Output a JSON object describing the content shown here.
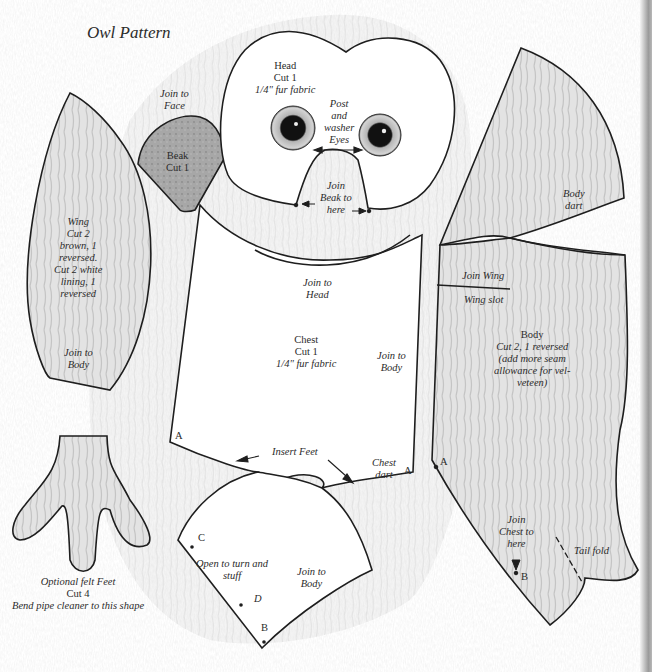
{
  "title": "Owl Pattern",
  "pieces": {
    "beak": {
      "note_above": [
        "Join to",
        "Face"
      ],
      "label": [
        "Beak",
        "Cut 1"
      ]
    },
    "head": {
      "label": [
        "Head",
        "Cut 1",
        "1/4\" fur fabric"
      ],
      "eyes_note": [
        "Post",
        "and",
        "washer",
        "Eyes"
      ],
      "beak_join": [
        "Join",
        "Beak to",
        "here"
      ]
    },
    "wing": {
      "label": [
        "Wing",
        "Cut 2",
        "brown, 1",
        "reversed.",
        "Cut 2 white",
        "lining, 1",
        "reversed"
      ],
      "join": [
        "Join to",
        "Body"
      ]
    },
    "chest": {
      "join_head": [
        "Join to",
        "Head"
      ],
      "label": [
        "Chest",
        "Cut 1",
        "1/4\" fur fabric"
      ],
      "join_body": [
        "Join to",
        "Body"
      ],
      "insert_feet": "Insert Feet",
      "chest_dart": [
        "Chest",
        "dart"
      ],
      "point_a_left": "A",
      "point_a_right": "A"
    },
    "chest_lower": {
      "open_note": [
        "Open to turn and",
        "stuff"
      ],
      "join_body": [
        "Join to",
        "Body"
      ],
      "point_c": "C",
      "point_d": "D",
      "point_b": "B"
    },
    "body": {
      "dart": [
        "Body",
        "dart"
      ],
      "join_wing": "Join Wing",
      "wing_slot": "Wing slot",
      "label": [
        "Body",
        "Cut 2, 1 reversed",
        "(add more seam",
        "allowance for vel-",
        "veteen)"
      ],
      "join_chest": [
        "Join",
        "Chest to",
        "here"
      ],
      "tail_fold": "Tail fold",
      "point_a": "A",
      "point_b": "B"
    },
    "feet": {
      "label": [
        "Optional felt Feet",
        "Cut 4",
        "Bend pipe cleaner to this shape"
      ]
    }
  },
  "colors": {
    "outline": "#1e1e1e",
    "fur_fill": "#dcdcdc",
    "beak_fill": "#a9a9a9",
    "paper": "#ffffff"
  }
}
